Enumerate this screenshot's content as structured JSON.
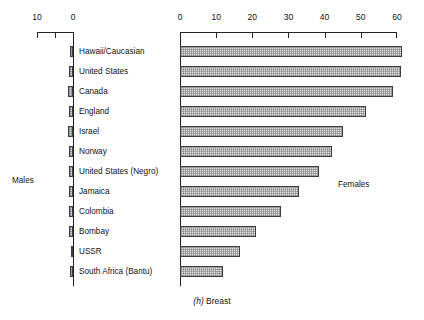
{
  "caption": {
    "index": "(h)",
    "title": "Breast"
  },
  "annotations": {
    "males": "Males",
    "females": "Females"
  },
  "left_axis": {
    "ticks": [
      "10",
      "0"
    ],
    "minor_ticks": [
      "5"
    ]
  },
  "right_axis": {
    "ticks": [
      "0",
      "10",
      "20",
      "30",
      "40",
      "50",
      "60"
    ]
  },
  "chart_data": {
    "type": "bar",
    "orientation": "horizontal",
    "title": "(h) Breast",
    "subtitle": "",
    "xlabel": "",
    "ylabel": "",
    "grid": false,
    "legend_position": "inline-annotations",
    "categories": [
      "Hawaii/Caucasian",
      "United States",
      "Canada",
      "England",
      "Israel",
      "Norway",
      "United States (Negro)",
      "Jamaica",
      "Colombia",
      "Bombay",
      "USSR",
      "South Africa (Bantu)"
    ],
    "series": [
      {
        "name": "Females",
        "axis": "right",
        "xlim": [
          0,
          60
        ],
        "xticks": [
          0,
          10,
          20,
          30,
          40,
          50,
          60
        ],
        "values": [
          61.5,
          61.0,
          59.0,
          51.5,
          45.0,
          42.0,
          38.5,
          33.0,
          28.0,
          21.0,
          16.5,
          12.0
        ]
      },
      {
        "name": "Males",
        "axis": "left",
        "xlim": [
          10,
          0
        ],
        "xticks": [
          10,
          5,
          0
        ],
        "values": [
          0.7,
          1.1,
          1.3,
          1.2,
          1.5,
          1.2,
          1.1,
          1.0,
          1.2,
          1.1,
          0.3,
          0.8
        ]
      }
    ]
  }
}
